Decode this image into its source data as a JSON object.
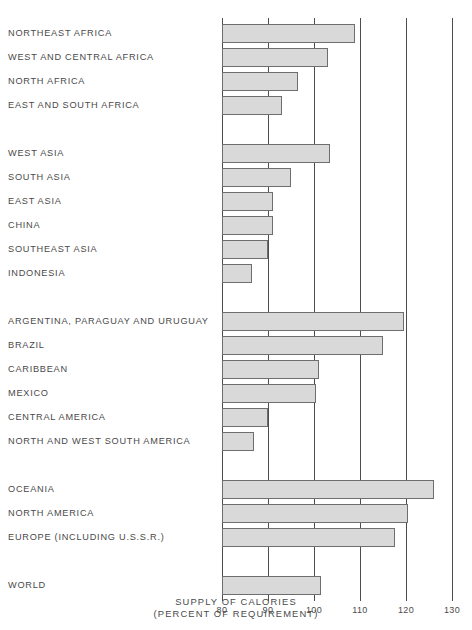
{
  "chart_data": {
    "type": "bar",
    "orientation": "horizontal",
    "title": "SUPPLY OF CALORIES",
    "subtitle": "(PERCENT OF REQUIREMENT)",
    "xlabel": "SUPPLY OF CALORIES (PERCENT OF REQUIREMENT)",
    "ylabel": "",
    "xlim": [
      80,
      130
    ],
    "xticks": [
      80,
      90,
      100,
      110,
      120,
      130
    ],
    "xtick_labels": [
      "80",
      "90",
      "100",
      "110",
      "120",
      "130"
    ],
    "grid": true,
    "legend": "none",
    "bar_color": "#d9d9d9",
    "bar_edge_color": "#6e6e6e",
    "axis_color": "#4d4d4d",
    "categories": [
      "NORTHEAST AFRICA",
      "WEST AND CENTRAL AFRICA",
      "NORTH AFRICA",
      "EAST AND SOUTH AFRICA",
      "WEST ASIA",
      "SOUTH ASIA",
      "EAST ASIA",
      "CHINA",
      "SOUTHEAST ASIA",
      "INDONESIA",
      "ARGENTINA, PARAGUAY AND URUGUAY",
      "BRAZIL",
      "CARIBBEAN",
      "MEXICO",
      "CENTRAL AMERICA",
      "NORTH AND WEST SOUTH AMERICA",
      "OCEANIA",
      "NORTH AMERICA",
      "EUROPE (INCLUDING U.S.S.R.)",
      "WORLD"
    ],
    "values": [
      109,
      103,
      96.5,
      93,
      103.5,
      95,
      91,
      91,
      90,
      86.5,
      119.5,
      115,
      101,
      100.5,
      90,
      87,
      126,
      120.5,
      117.5,
      101.5
    ],
    "groups": [
      {
        "name": "africa",
        "start_index": 0,
        "count": 4
      },
      {
        "name": "asia",
        "start_index": 4,
        "count": 6
      },
      {
        "name": "latin-america",
        "start_index": 10,
        "count": 6
      },
      {
        "name": "developed",
        "start_index": 16,
        "count": 3
      },
      {
        "name": "world",
        "start_index": 19,
        "count": 1
      }
    ]
  }
}
